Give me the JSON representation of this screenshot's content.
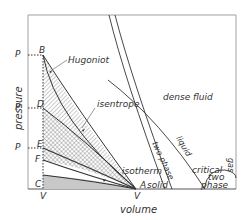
{
  "diagram": {
    "type": "pressure-volume phase diagram",
    "axes": {
      "x_label": "volume",
      "y_label": "pressure",
      "x_ticks": [
        "V",
        "V0"
      ],
      "y_ticks": [
        "PH",
        "PD",
        "PI"
      ]
    },
    "points": {
      "A": "A",
      "B": "B",
      "C": "C",
      "D": "D",
      "E": "E",
      "F": "F"
    },
    "curves": {
      "hugoniot": "Hugoniot",
      "isentrope": "isentrope",
      "isotherm": "isotherm"
    },
    "regions": {
      "solid": "solid",
      "dense_fluid": "dense fluid",
      "two_phase_label_1": "two",
      "two_phase_label_2": "phase",
      "critical": "critical",
      "gas": "gas",
      "liquid": "liquid",
      "two_phase_band": "two phase"
    },
    "colors": {
      "line": "#333333",
      "hatch": "#555555",
      "gray_fill": "#c8c8c8",
      "background": "#ffffff"
    }
  }
}
